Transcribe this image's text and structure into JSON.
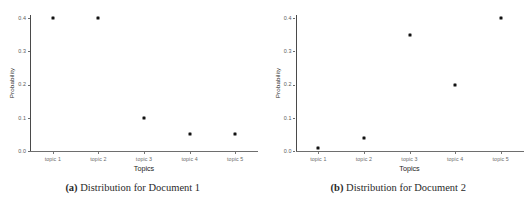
{
  "figure": {
    "background_color": "#ffffff",
    "point_color": "#111111",
    "axis_color": "#4a4a4a"
  },
  "subfigures": [
    {
      "tag": "(a)",
      "caption": "Distribution for Document 1",
      "chart": {
        "ylabel": "Probability",
        "xlabel": "Topics",
        "ytick_labels": [
          "0.0",
          "0.1",
          "0.2",
          "0.3",
          "0.4"
        ],
        "xtick_labels": [
          "topic 1",
          "topic 2",
          "topic 3",
          "topic 4",
          "topic 5"
        ]
      }
    },
    {
      "tag": "(b)",
      "caption": "Distribution for Document 2",
      "chart": {
        "ylabel": "Probability",
        "xlabel": "Topics",
        "ytick_labels": [
          "0.0",
          "0.1",
          "0.2",
          "0.3",
          "0.4"
        ],
        "xtick_labels": [
          "topic 1",
          "topic 2",
          "topic 3",
          "topic 4",
          "topic 5"
        ]
      }
    }
  ],
  "chart_data": [
    {
      "type": "scatter",
      "title": "Distribution for Document 1",
      "categories": [
        "topic 1",
        "topic 2",
        "topic 3",
        "topic 4",
        "topic 5"
      ],
      "values": [
        0.4,
        0.4,
        0.1,
        0.05,
        0.05
      ],
      "xlabel": "Topics",
      "ylabel": "Probability",
      "ylim": [
        0.0,
        0.4
      ],
      "yticks": [
        0.0,
        0.1,
        0.2,
        0.3,
        0.4
      ],
      "grid": false,
      "legend": "none",
      "marker": "square"
    },
    {
      "type": "scatter",
      "title": "Distribution for Document 2",
      "categories": [
        "topic 1",
        "topic 2",
        "topic 3",
        "topic 4",
        "topic 5"
      ],
      "values": [
        0.01,
        0.04,
        0.35,
        0.2,
        0.4
      ],
      "xlabel": "Topics",
      "ylabel": "Probability",
      "ylim": [
        0.0,
        0.4
      ],
      "yticks": [
        0.0,
        0.1,
        0.2,
        0.3,
        0.4
      ],
      "grid": false,
      "legend": "none",
      "marker": "square"
    }
  ]
}
